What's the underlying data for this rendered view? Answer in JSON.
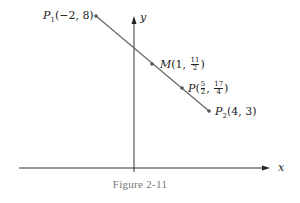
{
  "figure": {
    "caption": "Figure 2-11",
    "axes": {
      "x_label": "x",
      "y_label": "y"
    },
    "points": [
      {
        "id": "P1",
        "name": "P",
        "sub": "1",
        "coords": "(−2, 8)",
        "x": -2,
        "y": 8
      },
      {
        "id": "M",
        "name": "M",
        "coord_x": "1",
        "coord_y_num": "11",
        "coord_y_den": "2",
        "x": 1,
        "y": 5.5
      },
      {
        "id": "P",
        "name": "P",
        "coord_x_num": "5",
        "coord_x_den": "2",
        "coord_y_num": "17",
        "coord_y_den": "4",
        "x": 2.5,
        "y": 4.25
      },
      {
        "id": "P2",
        "name": "P",
        "sub": "2",
        "coords": "(4, 3)",
        "x": 4,
        "y": 3
      }
    ],
    "colors": {
      "line": "#666666",
      "axes": "#333333",
      "caption": "#777777"
    }
  }
}
